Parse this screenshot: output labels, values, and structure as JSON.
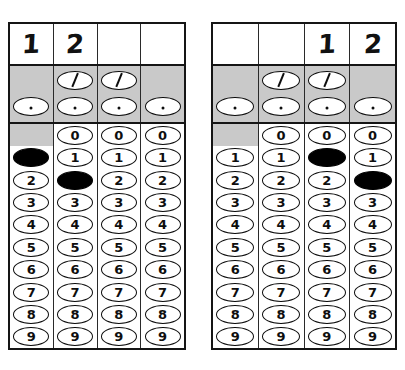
{
  "document": {
    "kind": "grid-in-answer-sheet",
    "colors": {
      "ink": "#0e0e0e",
      "band_gray": "#c9c9c9",
      "paper": "#ffffff",
      "filled_bubble": "#000000"
    },
    "digits": [
      "0",
      "1",
      "2",
      "3",
      "4",
      "5",
      "6",
      "7",
      "8",
      "9"
    ],
    "symbols": {
      "slash": "/",
      "dot": "."
    }
  },
  "grids": [
    {
      "name": "left-grid",
      "written_answer": [
        "1",
        "2",
        "",
        ""
      ],
      "columns": [
        {
          "index": 1,
          "written": "1",
          "has_slash_bubble": false,
          "has_dot_bubble": true,
          "has_zero_bubble": false,
          "filled_value": "1",
          "bubbles": [
            "",
            "1",
            "2",
            "3",
            "4",
            "5",
            "6",
            "7",
            "8",
            "9"
          ]
        },
        {
          "index": 2,
          "written": "2",
          "has_slash_bubble": true,
          "has_dot_bubble": true,
          "has_zero_bubble": true,
          "filled_value": "2",
          "bubbles": [
            "0",
            "1",
            "2",
            "3",
            "4",
            "5",
            "6",
            "7",
            "8",
            "9"
          ]
        },
        {
          "index": 3,
          "written": "",
          "has_slash_bubble": true,
          "has_dot_bubble": true,
          "has_zero_bubble": true,
          "filled_value": null,
          "bubbles": [
            "0",
            "1",
            "2",
            "3",
            "4",
            "5",
            "6",
            "7",
            "8",
            "9"
          ]
        },
        {
          "index": 4,
          "written": "",
          "has_slash_bubble": false,
          "has_dot_bubble": true,
          "has_zero_bubble": true,
          "filled_value": null,
          "bubbles": [
            "0",
            "1",
            "2",
            "3",
            "4",
            "5",
            "6",
            "7",
            "8",
            "9"
          ]
        }
      ]
    },
    {
      "name": "right-grid",
      "written_answer": [
        "",
        "",
        "1",
        "2"
      ],
      "columns": [
        {
          "index": 1,
          "written": "",
          "has_slash_bubble": false,
          "has_dot_bubble": true,
          "has_zero_bubble": false,
          "filled_value": null,
          "bubbles": [
            "",
            "1",
            "2",
            "3",
            "4",
            "5",
            "6",
            "7",
            "8",
            "9"
          ]
        },
        {
          "index": 2,
          "written": "",
          "has_slash_bubble": true,
          "has_dot_bubble": true,
          "has_zero_bubble": true,
          "filled_value": null,
          "bubbles": [
            "0",
            "1",
            "2",
            "3",
            "4",
            "5",
            "6",
            "7",
            "8",
            "9"
          ]
        },
        {
          "index": 3,
          "written": "1",
          "has_slash_bubble": true,
          "has_dot_bubble": true,
          "has_zero_bubble": true,
          "filled_value": "1",
          "bubbles": [
            "0",
            "1",
            "2",
            "3",
            "4",
            "5",
            "6",
            "7",
            "8",
            "9"
          ]
        },
        {
          "index": 4,
          "written": "2",
          "has_slash_bubble": false,
          "has_dot_bubble": true,
          "has_zero_bubble": true,
          "filled_value": "2",
          "bubbles": [
            "0",
            "1",
            "2",
            "3",
            "4",
            "5",
            "6",
            "7",
            "8",
            "9"
          ]
        }
      ]
    }
  ]
}
